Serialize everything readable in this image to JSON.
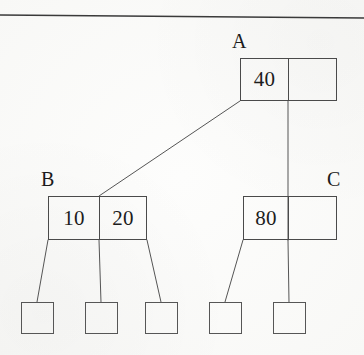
{
  "figure": {
    "type": "b-tree-diagram",
    "caption": "",
    "background_color": "#fbfbf9",
    "ink_color": "#4a4a4a"
  },
  "top_rule": {
    "name": "horizontal-rule",
    "x1": 0,
    "y1": 15,
    "x2": 364,
    "y2": 18,
    "color": "#3a3a3a"
  },
  "nodes": [
    {
      "id": "A",
      "label": "A",
      "label_x": 232,
      "label_y": 31,
      "x": 240,
      "y": 58,
      "width": 97,
      "height": 43,
      "divider_x": 48,
      "cells": [
        "40",
        ""
      ]
    },
    {
      "id": "B",
      "label": "B",
      "label_x": 41,
      "label_y": 169,
      "x": 48,
      "y": 196,
      "width": 99,
      "height": 44,
      "divider_x": 51,
      "cells": [
        "10",
        "20"
      ]
    },
    {
      "id": "C",
      "label": "C",
      "label_x": 327,
      "label_y": 169,
      "x": 243,
      "y": 196,
      "width": 94,
      "height": 44,
      "divider_x": 45,
      "cells": [
        "80",
        ""
      ]
    }
  ],
  "leaves": [
    {
      "id": "leaf-1",
      "parent": "B",
      "x": 21,
      "y": 302,
      "width": 33,
      "height": 32,
      "value": ""
    },
    {
      "id": "leaf-2",
      "parent": "B",
      "x": 85,
      "y": 302,
      "width": 33,
      "height": 32,
      "value": ""
    },
    {
      "id": "leaf-3",
      "parent": "B",
      "x": 145,
      "y": 302,
      "width": 33,
      "height": 32,
      "value": ""
    },
    {
      "id": "leaf-4",
      "parent": "C",
      "x": 209,
      "y": 302,
      "width": 33,
      "height": 32,
      "value": ""
    },
    {
      "id": "leaf-5",
      "parent": "C",
      "x": 273,
      "y": 302,
      "width": 33,
      "height": 32,
      "value": ""
    }
  ],
  "edges": [
    {
      "id": "edge-a-to-b",
      "from": "A",
      "to": "B",
      "x1": 240,
      "y1": 101,
      "x2": 99,
      "y2": 196
    },
    {
      "id": "edge-a-to-c",
      "from": "A",
      "to": "C",
      "x1": 288,
      "y1": 101,
      "x2": 288,
      "y2": 240
    },
    {
      "id": "edge-b-to-leaf-1",
      "from": "B",
      "to": "leaf-1",
      "x1": 48,
      "y1": 240,
      "x2": 37,
      "y2": 302
    },
    {
      "id": "edge-b-to-leaf-2",
      "from": "B",
      "to": "leaf-2",
      "x1": 99,
      "y1": 240,
      "x2": 101,
      "y2": 302
    },
    {
      "id": "edge-b-to-leaf-3",
      "from": "B",
      "to": "leaf-3",
      "x1": 147,
      "y1": 240,
      "x2": 161,
      "y2": 302
    },
    {
      "id": "edge-c-to-leaf-4",
      "from": "C",
      "to": "leaf-4",
      "x1": 243,
      "y1": 240,
      "x2": 225,
      "y2": 302
    },
    {
      "id": "edge-c-to-leaf-5",
      "from": "C",
      "to": "leaf-5",
      "x1": 288,
      "y1": 240,
      "x2": 289,
      "y2": 302
    }
  ],
  "chart_data": {
    "type": "diagram",
    "title": "",
    "tree": {
      "root": {
        "name": "A",
        "keys": [
          "40"
        ],
        "capacity": 2,
        "children": [
          {
            "name": "B",
            "keys": [
              "10",
              "20"
            ],
            "capacity": 2,
            "children": [
              {
                "name": "leaf-1",
                "keys": []
              },
              {
                "name": "leaf-2",
                "keys": []
              },
              {
                "name": "leaf-3",
                "keys": []
              }
            ]
          },
          {
            "name": "C",
            "keys": [
              "80"
            ],
            "capacity": 2,
            "children": [
              {
                "name": "leaf-4",
                "keys": []
              },
              {
                "name": "leaf-5",
                "keys": []
              }
            ]
          }
        ]
      }
    }
  }
}
